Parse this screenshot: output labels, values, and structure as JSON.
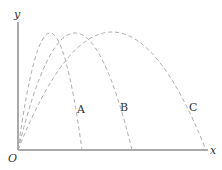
{
  "labels": {
    "y_axis": "y",
    "x_axis": "x",
    "origin": "O",
    "curve_a": "A",
    "curve_b": "B",
    "curve_c": "C"
  },
  "colors": {
    "axis": "#555555",
    "curve": "#aaaaaa",
    "text": "#333333"
  }
}
